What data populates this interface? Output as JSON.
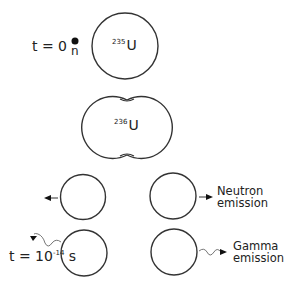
{
  "diagram": {
    "type": "nuclear-fission-sequence",
    "time_start": {
      "label": "t = 0"
    },
    "time_end": {
      "prefix": "t = 10",
      "exponent": "-14",
      "unit": "s"
    },
    "neutron": {
      "symbol": "n"
    },
    "nucleus_initial": {
      "mass_number": "235",
      "element": "U"
    },
    "nucleus_compound": {
      "mass_number": "236",
      "element": "U"
    },
    "emissions": [
      {
        "line1": "Neutron",
        "line2": "emission"
      },
      {
        "line1": "Gamma",
        "line2": "emission"
      }
    ],
    "colors": {
      "stroke": "#333333",
      "text": "#222222",
      "background": "#ffffff"
    }
  }
}
